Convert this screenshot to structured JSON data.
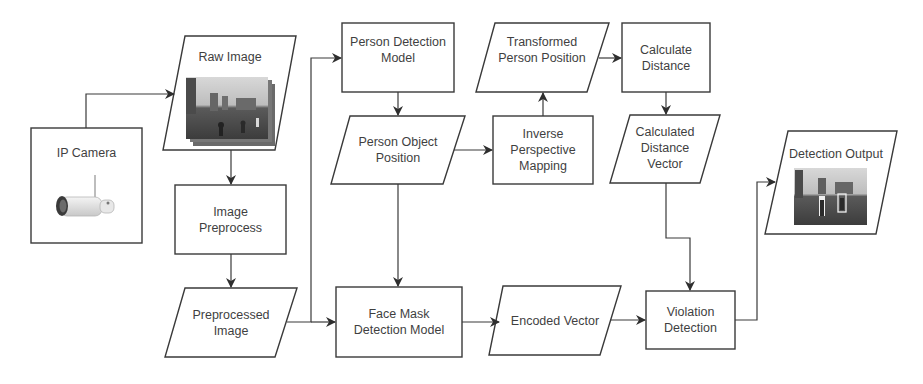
{
  "diagram": {
    "type": "flowchart",
    "colors": {
      "stroke": "#3a3a3a",
      "text": "#3f3f3f",
      "background": "#ffffff"
    },
    "nodes": {
      "ip_camera": {
        "shape": "rectangle",
        "label": "IP Camera",
        "image": "camera-image"
      },
      "raw_image": {
        "shape": "parallelogram",
        "label": "Raw Image",
        "image": "park-scene-image-stack"
      },
      "image_preprocess": {
        "shape": "rectangle",
        "line1": "Image",
        "line2": "Preprocess"
      },
      "preprocessed_image": {
        "shape": "parallelogram",
        "line1": "Preprocessed",
        "line2": "Image"
      },
      "person_detection_model": {
        "shape": "rectangle",
        "line1": "Person Detection",
        "line2": "Model"
      },
      "person_object_position": {
        "shape": "parallelogram",
        "line1": "Person Object",
        "line2": "Position"
      },
      "transformed_person_position": {
        "shape": "parallelogram",
        "line1": "Transformed",
        "line2": "Person Position"
      },
      "inverse_perspective_mapping": {
        "shape": "rectangle",
        "line1": "Inverse",
        "line2": "Perspective",
        "line3": "Mapping"
      },
      "calculate_distance": {
        "shape": "rectangle",
        "line1": "Calculate",
        "line2": "Distance"
      },
      "calculated_distance_vector": {
        "shape": "parallelogram",
        "line1": "Calculated",
        "line2": "Distance",
        "line3": "Vector"
      },
      "detection_output": {
        "shape": "parallelogram",
        "label": "Detection Output",
        "image": "detection-result-image"
      },
      "face_mask_detection_model": {
        "shape": "rectangle",
        "line1": "Face Mask",
        "line2": "Detection Model"
      },
      "encoded_vector": {
        "shape": "parallelogram",
        "label": "Encoded Vector"
      },
      "violation_detection": {
        "shape": "rectangle",
        "line1": "Violation",
        "line2": "Detection"
      }
    },
    "edges": [
      {
        "from": "IP Camera",
        "to": "Raw Image"
      },
      {
        "from": "Raw Image",
        "to": "Image Preprocess"
      },
      {
        "from": "Image Preprocess",
        "to": "Preprocessed Image"
      },
      {
        "from": "Preprocessed Image",
        "to": "Person Detection Model"
      },
      {
        "from": "Preprocessed Image",
        "to": "Face Mask Detection Model"
      },
      {
        "from": "Person Detection Model",
        "to": "Person Object Position"
      },
      {
        "from": "Person Object Position",
        "to": "Inverse Perspective Mapping"
      },
      {
        "from": "Person Object Position",
        "to": "Face Mask Detection Model"
      },
      {
        "from": "Inverse Perspective Mapping",
        "to": "Transformed Person Position"
      },
      {
        "from": "Transformed Person Position",
        "to": "Calculate Distance"
      },
      {
        "from": "Calculate Distance",
        "to": "Calculated Distance Vector"
      },
      {
        "from": "Calculated Distance Vector",
        "to": "Violation Detection"
      },
      {
        "from": "Face Mask Detection Model",
        "to": "Encoded Vector"
      },
      {
        "from": "Encoded Vector",
        "to": "Violation Detection"
      },
      {
        "from": "Violation Detection",
        "to": "Detection Output"
      }
    ]
  }
}
